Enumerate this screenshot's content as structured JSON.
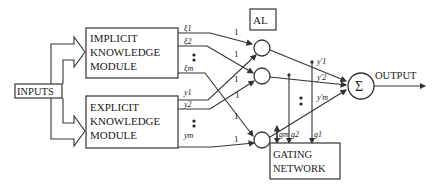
{
  "diagram": {
    "inputs_label": "INPUTS",
    "output_label": "OUTPUT",
    "implicit_module": {
      "line1": "IMPLICIT",
      "line2": "KNOWLEDGE",
      "line3": "MODULE",
      "outputs": [
        "ξ1",
        "ξ2",
        "ξm"
      ]
    },
    "explicit_module": {
      "line1": "EXPLICIT",
      "line2": "KNOWLEDGE",
      "line3": "MODULE",
      "outputs": [
        "y1",
        "y2",
        "ym"
      ]
    },
    "al_label": "AL",
    "weights": [
      "1",
      "1",
      "1",
      "1",
      "1",
      "1"
    ],
    "combined_outputs": [
      "y'1",
      "y'2",
      "y'm"
    ],
    "gating_network": {
      "line1": "GATING",
      "line2": "NETWORK"
    },
    "gates": [
      "gm",
      "g2",
      "g1"
    ],
    "sum_symbol": "Σ",
    "ellipsis": "⋮"
  }
}
